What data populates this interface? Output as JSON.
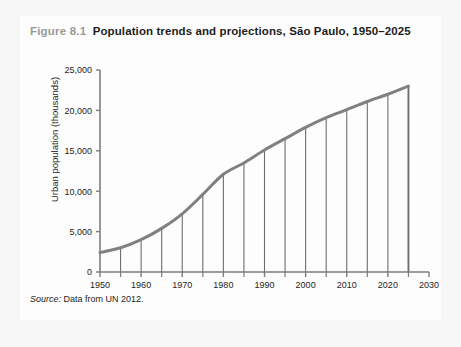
{
  "figure": {
    "number": "Figure 8.1",
    "title": "Population trends and projections, São Paulo, 1950–2025",
    "source_label": "Source:",
    "source_text": " Data from UN 2012."
  },
  "colors": {
    "page_background": "#f7f7f7",
    "card_background": "#fdfdfd",
    "series_line": "#808080",
    "drop_line": "#6e6e6e",
    "axis": "#7d7d7d",
    "text": "#1d1d1d",
    "fignum": "#9a9a9a"
  },
  "chart_data": {
    "type": "line",
    "title": "Population trends and projections, São Paulo, 1950–2025",
    "xlabel": "",
    "ylabel": "Urban population (thousands)",
    "xlim": [
      1950,
      2030
    ],
    "ylim": [
      0,
      25000
    ],
    "grid": false,
    "legend": "none",
    "x_ticks": [
      1950,
      1960,
      1970,
      1980,
      1990,
      2000,
      2010,
      2020,
      2030
    ],
    "x_tick_labels": [
      "1950",
      "1960",
      "1970",
      "1980",
      "1990",
      "2000",
      "2010",
      "2020",
      "2030"
    ],
    "x_minor_ticks": [
      1955,
      1965,
      1975,
      1985,
      1995,
      2005,
      2015,
      2025
    ],
    "y_ticks": [
      0,
      5000,
      10000,
      15000,
      20000,
      25000
    ],
    "y_tick_labels": [
      "0",
      "5,000",
      "10,000",
      "15,000",
      "20,000",
      "25,000"
    ],
    "drop_lines_at_x": [
      1955,
      1960,
      1965,
      1970,
      1975,
      1980,
      1985,
      1990,
      1995,
      2000,
      2005,
      2010,
      2015,
      2020,
      2025
    ],
    "series": [
      {
        "name": "Urban population, São Paulo",
        "x": [
          1950,
          1955,
          1960,
          1965,
          1970,
          1975,
          1980,
          1985,
          1990,
          1995,
          2000,
          2005,
          2010,
          2015,
          2020,
          2025
        ],
        "values": [
          2400,
          3000,
          4000,
          5400,
          7200,
          9600,
          12100,
          13500,
          15100,
          16500,
          17900,
          19100,
          20100,
          21100,
          22000,
          23000
        ]
      }
    ]
  }
}
